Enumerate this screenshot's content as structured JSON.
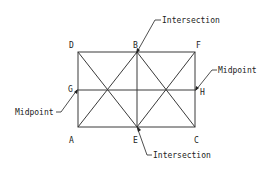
{
  "diagram": {
    "type": "rectangle-diagonals-snap-points",
    "colors": {
      "line": "#3a3a3a",
      "text": "#222222",
      "background": "#ffffff"
    },
    "points": {
      "A": {
        "label": "A",
        "x": 78,
        "y": 127
      },
      "B": {
        "label": "B",
        "x": 137,
        "y": 52
      },
      "C": {
        "label": "C",
        "x": 195,
        "y": 127
      },
      "D": {
        "label": "D",
        "x": 78,
        "y": 52
      },
      "E": {
        "label": "E",
        "x": 137,
        "y": 127
      },
      "F": {
        "label": "F",
        "x": 195,
        "y": 52
      },
      "G": {
        "label": "G",
        "x": 78,
        "y": 90
      },
      "H": {
        "label": "H",
        "x": 195,
        "y": 90
      }
    },
    "callouts": {
      "top_intersection": {
        "text": "Intersection",
        "target": "B"
      },
      "right_midpoint": {
        "text": "Midpoint",
        "target": "H"
      },
      "left_midpoint": {
        "text": "Midpoint",
        "target": "G"
      },
      "bottom_intersection": {
        "text": "Intersection",
        "target": "E"
      }
    }
  }
}
